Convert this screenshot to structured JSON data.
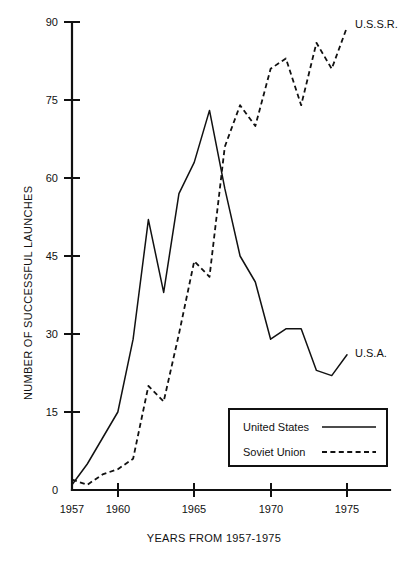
{
  "chart_data": {
    "type": "line",
    "title": "",
    "xlabel": "YEARS FROM 1957-1975",
    "ylabel": "NUMBER OF SUCCESSFUL LAUNCHES",
    "x": [
      1957,
      1958,
      1959,
      1960,
      1961,
      1962,
      1963,
      1964,
      1965,
      1966,
      1967,
      1968,
      1969,
      1970,
      1971,
      1972,
      1973,
      1974,
      1975
    ],
    "xlim": [
      1957,
      1975
    ],
    "ylim": [
      0,
      90
    ],
    "xticks": [
      1957,
      1960,
      1965,
      1970,
      1975
    ],
    "xtick_labels": [
      "1957",
      "1960",
      "1965",
      "1970",
      "1975"
    ],
    "yticks": [
      0,
      15,
      30,
      45,
      60,
      75,
      90
    ],
    "ytick_labels": [
      "0",
      "15",
      "30",
      "45",
      "60",
      "75",
      "90"
    ],
    "grid": false,
    "legend_position": "lower-right",
    "series": [
      {
        "name": "United States",
        "style": "solid",
        "end_label": "U.S.A.",
        "color": "#111111",
        "values": [
          1,
          5,
          10,
          15,
          29,
          52,
          38,
          57,
          63,
          73,
          58,
          45,
          40,
          29,
          31,
          31,
          23,
          22,
          26
        ]
      },
      {
        "name": "Soviet Union",
        "style": "dashed",
        "end_label": "U.S.S.R.",
        "color": "#111111",
        "values": [
          2,
          1,
          3,
          4,
          6,
          20,
          17,
          30,
          44,
          41,
          66,
          74,
          70,
          81,
          83,
          74,
          86,
          81,
          89
        ]
      }
    ]
  },
  "legend": {
    "entries": [
      {
        "label": "United States",
        "style": "solid"
      },
      {
        "label": "Soviet Union",
        "style": "dashed"
      }
    ]
  },
  "annotations": {
    "ussr_end_label": "U.S.S.R.",
    "usa_end_label": "U.S.A."
  }
}
